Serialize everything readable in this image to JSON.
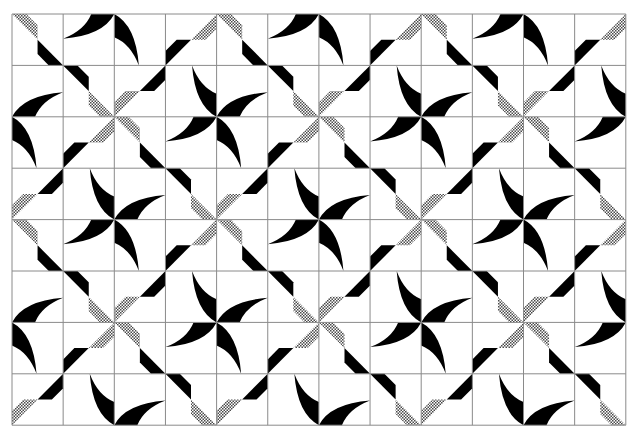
{
  "figure": {
    "grid": {
      "cols": 12,
      "rows": 8,
      "origin_x": 12,
      "origin_y": 14,
      "cell_w": 51.15,
      "cell_h": 51.4
    },
    "colors": {
      "background": "#ffffff",
      "ink": "#000000",
      "grid": "#8a8a8a",
      "hatch_a": "#ffffff",
      "hatch_b": "#555555"
    },
    "motif_legend": {
      "arc": "black crescent anchored at pinwheel-centre corner; rot = clockwise quarter turns (0 = anchored bottom-right, tip on top edge)",
      "stripe_A": "stepped band along top-left to bottom-right diagonal; parts [upper half, lower half]",
      "stripe_B": "stepped band along bottom-left to top-right diagonal; parts [upper-right half, lower-left half]",
      "fills": {
        "b": "solid black",
        "h": "cross-hatched"
      }
    },
    "tile_period": 4,
    "tile": [
      [
        {
          "t": "A",
          "f": [
            "h",
            "b"
          ]
        },
        {
          "t": "arc",
          "rot": 3
        },
        {
          "t": "arc",
          "rot": 2
        },
        {
          "t": "B",
          "f": [
            "h",
            "b"
          ]
        }
      ],
      [
        {
          "t": "arc",
          "rot": 1
        },
        {
          "t": "A",
          "f": [
            "b",
            "h"
          ]
        },
        {
          "t": "B",
          "f": [
            "b",
            "h"
          ]
        },
        {
          "t": "arc",
          "rot": 0
        }
      ],
      [
        {
          "t": "arc",
          "rot": 2
        },
        {
          "t": "B",
          "f": [
            "h",
            "b"
          ]
        },
        {
          "t": "A",
          "f": [
            "h",
            "b"
          ]
        },
        {
          "t": "arc",
          "rot": 3
        }
      ],
      [
        {
          "t": "B",
          "f": [
            "b",
            "h"
          ]
        },
        {
          "t": "arc",
          "rot": 0
        },
        {
          "t": "arc",
          "rot": 1
        },
        {
          "t": "A",
          "f": [
            "b",
            "h"
          ]
        }
      ]
    ]
  }
}
